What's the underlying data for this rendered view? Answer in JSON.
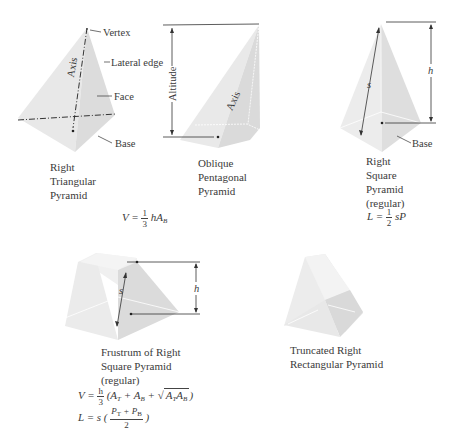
{
  "figures": {
    "right_triangular": {
      "labels": {
        "vertex": "Vertex",
        "lateral_edge": "Lateral edge",
        "face": "Face",
        "base": "Base",
        "axis": "Axis"
      },
      "caption": [
        "Right",
        "Triangular",
        "Pyramid"
      ]
    },
    "oblique_pentagonal": {
      "labels": {
        "altitude": "Altitude",
        "axis": "Axis"
      },
      "caption": [
        "Oblique",
        "Pentagonal",
        "Pyramid"
      ]
    },
    "right_square": {
      "labels": {
        "s": "s",
        "h": "h",
        "base": "Base"
      },
      "caption": [
        "Right",
        "Square",
        "Pyramid",
        "(regular)"
      ],
      "formula": {
        "lhs": "L =",
        "num": "1",
        "den": "2",
        "rhs": "sP"
      }
    },
    "frustum": {
      "labels": {
        "s": "s",
        "h": "h"
      },
      "caption": [
        "Frustrum of Right",
        "Square Pyramid",
        "(regular)"
      ],
      "formula_v": {
        "lhs": "V =",
        "num": "h",
        "den": "3",
        "open": "(A",
        "t1": "T",
        "plus1": " + A",
        "b1": "B",
        "plus2": " + ",
        "sqrt_sym": "√",
        "rad_a": "A",
        "rad_t": "T",
        "rad_a2": "A",
        "rad_b": "B",
        "close": ")"
      },
      "formula_l": {
        "lhs": "L = s (",
        "num_p1": "P",
        "num_t": "T",
        "num_plus": " + P",
        "num_b": "B",
        "den": "2",
        "close": ")"
      }
    },
    "truncated_rect": {
      "caption": [
        "Truncated Right",
        "Rectangular Pyramid"
      ]
    }
  },
  "shared_formula": {
    "lhs": "V =",
    "num": "1",
    "den": "3",
    "rhs": "hA",
    "sub": "B"
  },
  "colors": {
    "face_light": "#efefef",
    "face_mid": "#e2e2e2",
    "face_dark": "#d6d6d6",
    "line": "#333333"
  }
}
